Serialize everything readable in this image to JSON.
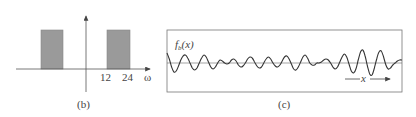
{
  "panel_b": {
    "caption": "(b)",
    "x_axis_label": "ω",
    "tick_labels": [
      "12",
      "24"
    ],
    "bands": [
      {
        "name": "negative-band",
        "from": -24,
        "to": -12
      },
      {
        "name": "positive-band",
        "from": 12,
        "to": 24
      }
    ],
    "fill_color": "#9a9a9a"
  },
  "panel_c": {
    "caption": "(c)",
    "function_label": "f",
    "function_subscript": "b",
    "function_arg": "(x)",
    "x_axis_label": "x",
    "waveform_points": [
      [
        0,
        10
      ],
      [
        3,
        4
      ],
      [
        6,
        -4
      ],
      [
        9,
        -9
      ],
      [
        12,
        -8
      ],
      [
        15,
        -3
      ],
      [
        18,
        3
      ],
      [
        21,
        7
      ],
      [
        24,
        8
      ],
      [
        27,
        5
      ],
      [
        30,
        0
      ],
      [
        33,
        -5
      ],
      [
        36,
        -7
      ],
      [
        39,
        -5
      ],
      [
        42,
        0
      ],
      [
        45,
        5
      ],
      [
        48,
        8
      ],
      [
        51,
        6
      ],
      [
        54,
        1
      ],
      [
        57,
        -4
      ],
      [
        60,
        -6
      ],
      [
        63,
        -4
      ],
      [
        66,
        0
      ],
      [
        69,
        3
      ],
      [
        72,
        2
      ],
      [
        75,
        0
      ],
      [
        78,
        -1
      ],
      [
        81,
        0
      ],
      [
        84,
        3
      ],
      [
        87,
        4
      ],
      [
        90,
        2
      ],
      [
        93,
        -2
      ],
      [
        96,
        -4
      ],
      [
        99,
        -3
      ],
      [
        102,
        0
      ],
      [
        105,
        4
      ],
      [
        108,
        6
      ],
      [
        111,
        5
      ],
      [
        114,
        1
      ],
      [
        117,
        -3
      ],
      [
        120,
        -5
      ],
      [
        123,
        -4
      ],
      [
        126,
        0
      ],
      [
        129,
        4
      ],
      [
        132,
        6
      ],
      [
        135,
        4
      ],
      [
        138,
        0
      ],
      [
        141,
        -3
      ],
      [
        144,
        -4
      ],
      [
        147,
        -2
      ],
      [
        150,
        2
      ],
      [
        153,
        6
      ],
      [
        156,
        7
      ],
      [
        159,
        4
      ],
      [
        162,
        -1
      ],
      [
        165,
        -6
      ],
      [
        168,
        -7
      ],
      [
        171,
        -4
      ],
      [
        174,
        1
      ],
      [
        177,
        6
      ],
      [
        180,
        8
      ],
      [
        183,
        5
      ],
      [
        186,
        0
      ],
      [
        189,
        -2
      ],
      [
        192,
        -2
      ],
      [
        195,
        0
      ],
      [
        198,
        0
      ],
      [
        201,
        1
      ],
      [
        204,
        3
      ],
      [
        207,
        4
      ],
      [
        210,
        3
      ],
      [
        213,
        0
      ],
      [
        216,
        -4
      ],
      [
        219,
        -6
      ],
      [
        222,
        -4
      ],
      [
        225,
        1
      ],
      [
        228,
        6
      ],
      [
        231,
        9
      ],
      [
        234,
        6
      ],
      [
        237,
        -1
      ],
      [
        240,
        -8
      ],
      [
        243,
        -10
      ],
      [
        246,
        -6
      ],
      [
        249,
        3
      ],
      [
        252,
        11
      ],
      [
        255,
        13
      ],
      [
        258,
        7
      ],
      [
        261,
        -3
      ],
      [
        264,
        -11
      ],
      [
        267,
        -12
      ],
      [
        270,
        -5
      ],
      [
        273,
        4
      ],
      [
        276,
        11
      ],
      [
        279,
        12
      ],
      [
        282,
        6
      ],
      [
        285,
        -2
      ],
      [
        288,
        -6
      ],
      [
        291,
        -5
      ],
      [
        294,
        -2
      ],
      [
        297,
        0
      ],
      [
        300,
        2
      ],
      [
        303,
        3
      ],
      [
        306,
        3
      ]
    ]
  },
  "colors": {
    "ink": "#444444",
    "band_fill": "#9a9a9a"
  }
}
